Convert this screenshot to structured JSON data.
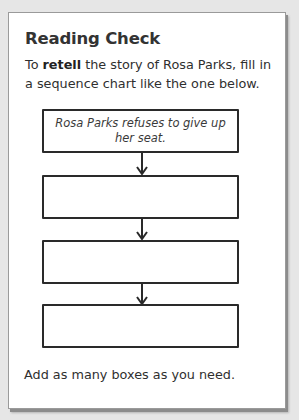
{
  "card": {
    "title": "Reading Check",
    "intro": {
      "prefix": "To ",
      "bold": "retell",
      "suffix": " the story of Rosa Parks, fill in a sequence chart like the one below."
    },
    "sequence_chart": {
      "boxes": [
        {
          "text": "Rosa Parks refuses to give up her seat."
        },
        {
          "text": ""
        },
        {
          "text": ""
        },
        {
          "text": ""
        }
      ],
      "arrow_icon": "arrow-down-icon"
    },
    "footer": "Add as many boxes as you need."
  },
  "colors": {
    "background": "#e6e6e6",
    "card": "#ffffff",
    "text": "#2f2f2f",
    "box_border": "#2a2a2a"
  }
}
